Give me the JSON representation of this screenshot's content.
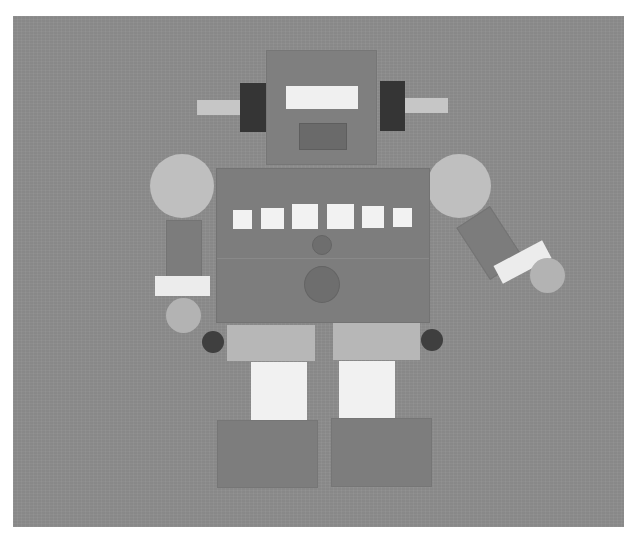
{
  "scene": {
    "subject": "paper-cutout robot collage",
    "colors": {
      "paper": "#8e8e8e",
      "head": "#7f7f7f",
      "ear": "#353535",
      "antenna": "#c6c6c6",
      "eyes": "#f0f0f0",
      "mouth": "#6a6a6a",
      "body": "#7d7d7d",
      "buttons": "#f2f2f2",
      "shoulders": "#bfbfbf",
      "cuffs": "#ececec",
      "hands": "#b3b3b3",
      "hips": "#b7b7b7",
      "joints": "#3f3f3f",
      "legs": "#f1f1f1",
      "feet": "#7d7d7d"
    },
    "parts": {
      "head": {
        "antennae": 2,
        "ears": 2,
        "eyes": 1,
        "mouth": 1
      },
      "torso": {
        "chest_buttons": 6,
        "circles": 2
      },
      "arms": [
        "left-arm-down",
        "right-arm-angled"
      ],
      "legs": 2,
      "feet": 2
    }
  }
}
